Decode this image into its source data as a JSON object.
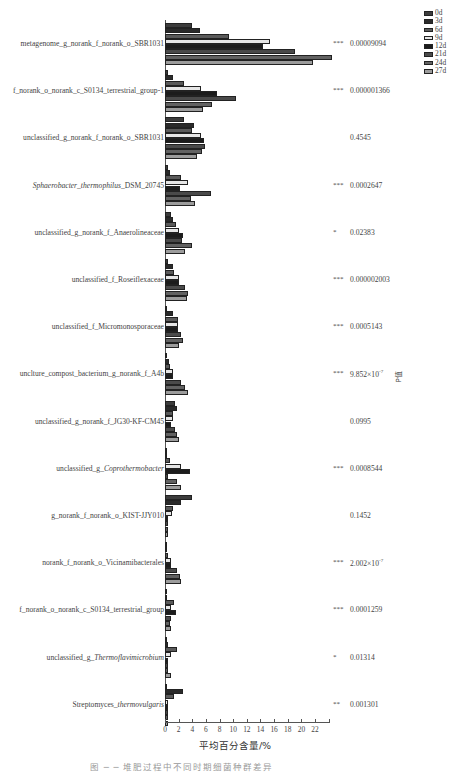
{
  "chart_data": {
    "type": "bar",
    "orientation": "horizontal",
    "title": "",
    "xlabel": "平均百分含量/%",
    "ylabel": "",
    "right_axis_label": "P值",
    "xlim": [
      0,
      24
    ],
    "xticks": [
      0,
      2,
      4,
      6,
      8,
      10,
      12,
      14,
      16,
      18,
      20,
      22
    ],
    "grid": false,
    "legend_position": "top-right",
    "series_names": [
      "0d",
      "3d",
      "6d",
      "9d",
      "12d",
      "21d",
      "24d",
      "27d"
    ],
    "series_colors": [
      "#3c3c3c",
      "#2a2a2a",
      "#5a5a5a",
      "#e6e6e6",
      "#1c1c1c",
      "#4a4a4a",
      "#626262",
      "#9c9c9c"
    ],
    "categories": [
      {
        "label": "metagenome_g_norank_f_norank_o_SBR1031",
        "sig": "***",
        "p": "0.00009094",
        "values": [
          4.0,
          5.1,
          9.4,
          15.4,
          14.3,
          19.0,
          24.5,
          21.7
        ]
      },
      {
        "label": "f_norank_o_norank_c_S0134_terrestrial_group-1",
        "sig": "***",
        "p": "0.000001366",
        "values": [
          0.4,
          1.2,
          2.8,
          5.3,
          7.6,
          10.4,
          6.9,
          5.6
        ]
      },
      {
        "label": "unclassified_g_norank_f_norank_o_SBR1031",
        "sig": "",
        "p": "0.4545",
        "values": [
          2.8,
          4.2,
          4.0,
          5.3,
          5.7,
          5.8,
          5.4,
          4.7
        ]
      },
      {
        "label_plain": "DSM_20745",
        "label_italic": "Sphaerobacter_thermophilus",
        "label": "Sphaerobacter_thermophilus_DSM_20745",
        "sig": "***",
        "p": "0.0002647",
        "values": [
          0.4,
          0.7,
          2.3,
          3.4,
          2.2,
          6.7,
          3.8,
          4.4
        ]
      },
      {
        "label": "unclassified_g_norank_f_Anaerolineaceae",
        "sig": "*",
        "p": "0.02383",
        "values": [
          0.9,
          1.1,
          1.6,
          2.1,
          2.6,
          2.5,
          4.0,
          3.0
        ]
      },
      {
        "label": "unclassified_f_Roseiflexaceae",
        "sig": "***",
        "p": "0.000002003",
        "values": [
          0.4,
          1.2,
          1.3,
          2.1,
          2.1,
          3.0,
          3.4,
          3.2
        ]
      },
      {
        "label": "unclassified_f_Micromonosporaceae",
        "sig": "***",
        "p": "0.0005143",
        "values": [
          0.3,
          1.2,
          1.9,
          1.9,
          1.9,
          2.3,
          2.7,
          2.1
        ]
      },
      {
        "label": "unclture_compost_bacterium_g_norank_f_A4b",
        "sig": "***",
        "p": "9.852×10",
        "p_exp": "-7",
        "values": [
          0.2,
          0.6,
          0.7,
          1.2,
          1.2,
          2.4,
          2.9,
          3.4
        ]
      },
      {
        "label": "unclassified_g_norank_f_JG30-KF-CM45",
        "sig": "",
        "p": "0.0995",
        "values": [
          1.4,
          1.7,
          1.2,
          1.2,
          0.9,
          1.5,
          1.8,
          2.1
        ]
      },
      {
        "label_plain": "unclassified_g_",
        "label_italic": "Coprothermobacter",
        "label": "unclassified_g_Coprothermobacter",
        "sig": "***",
        "p": "0.0008544",
        "values": [
          0.1,
          0.1,
          0.7,
          2.3,
          3.7,
          0.5,
          1.8,
          2.3
        ]
      },
      {
        "label": "g_norank_f_norank_o_KIST-JJY010",
        "sig": "",
        "p": "0.1452",
        "values": [
          3.9,
          2.4,
          1.2,
          1.0,
          0.5,
          0.5,
          0.5,
          0.4
        ]
      },
      {
        "label": "norank_f_norank_o_Vicinamibacterales",
        "sig": "***",
        "p": "2.002×10",
        "p_exp": "-7",
        "values": [
          0.1,
          0.3,
          0.4,
          0.9,
          0.9,
          1.7,
          2.2,
          2.4
        ]
      },
      {
        "label": "f_norank_o_norank_c_S0134_terrestrial_group",
        "sig": "***",
        "p": "0.0001259",
        "values": [
          0.1,
          0.3,
          1.3,
          0.9,
          1.6,
          0.9,
          0.8,
          0.9
        ]
      },
      {
        "label_plain": "unclassified_g_",
        "label_italic": "Thermoflavimicrobium",
        "label": "unclassified_g_Thermoflavimicrobium",
        "sig": "*",
        "p": "0.01314",
        "values": [
          0.3,
          0.5,
          1.8,
          0.9,
          0.5,
          0.4,
          0.4,
          0.9
        ]
      },
      {
        "label_plain": "Streptomyces_",
        "label_italic": "thermovulgaris",
        "label": "Streptomyces_thermovulgaris",
        "sig": "**",
        "p": "0.001301",
        "values": [
          0.1,
          2.6,
          1.3,
          0.4,
          0.4,
          0.4,
          0.4,
          0.4
        ]
      }
    ]
  },
  "caption": "图 ─ ─ 堆肥过程中不同时期细菌种群差异"
}
